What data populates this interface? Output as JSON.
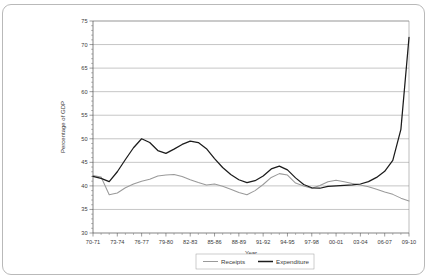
{
  "figure": {
    "border_color": "#b9b9b9",
    "background": "#ffffff"
  },
  "chart_data": {
    "type": "line",
    "title": "",
    "subtitle": "",
    "xlabel": "Year",
    "ylabel": "Percentage of GDP",
    "ylim": [
      30,
      75
    ],
    "ytick_step": 5,
    "yticks": [
      30,
      35,
      40,
      45,
      50,
      55,
      60,
      65,
      70,
      75
    ],
    "ytick_labels": [
      "30",
      "35",
      "40",
      "45",
      "50",
      "55",
      "60",
      "65",
      "70",
      "75"
    ],
    "grid": true,
    "grid_axis": "y",
    "legend_position": "bottom-center",
    "x": [
      "70-71",
      "71-72",
      "72-73",
      "73-74",
      "74-75",
      "75-76",
      "76-77",
      "77-78",
      "78-79",
      "79-80",
      "80-81",
      "81-82",
      "82-83",
      "83-84",
      "84-85",
      "85-86",
      "86-87",
      "87-88",
      "88-89",
      "89-90",
      "90-91",
      "91-92",
      "92-93",
      "93-94",
      "94-95",
      "95-96",
      "96-97",
      "97-98",
      "98-99",
      "99-00",
      "00-01",
      "01-02",
      "02-03",
      "03-04",
      "04-05",
      "05-06",
      "06-07",
      "07-08",
      "08-09",
      "09-10"
    ],
    "xtick_labels": [
      "70-71",
      "73-74",
      "76-77",
      "79-80",
      "82-83",
      "85-86",
      "88-89",
      "91-92",
      "94-95",
      "97-98",
      "00-01",
      "03-04",
      "06-07",
      "09-10"
    ],
    "xtick_every": 3,
    "series": [
      {
        "name": "Receipts",
        "color": "#9a9a9a",
        "values": [
          42.2,
          41.9,
          38.1,
          38.5,
          39.6,
          40.4,
          41.0,
          41.4,
          42.1,
          42.3,
          42.4,
          42.0,
          41.3,
          40.7,
          40.2,
          40.4,
          39.9,
          39.3,
          38.6,
          38.1,
          39.0,
          40.3,
          41.8,
          42.6,
          42.3,
          40.6,
          40.0,
          39.5,
          40.1,
          40.9,
          41.2,
          40.9,
          40.5,
          40.2,
          39.8,
          39.3,
          38.7,
          38.2,
          37.4,
          36.8
        ]
      },
      {
        "name": "Expenditure",
        "color": "#1c1c1c",
        "values": [
          42.0,
          41.6,
          40.9,
          43.0,
          45.6,
          48.1,
          50.0,
          49.2,
          47.5,
          46.9,
          47.8,
          48.8,
          49.5,
          49.2,
          47.9,
          45.8,
          43.9,
          42.4,
          41.3,
          40.7,
          41.1,
          42.1,
          43.6,
          44.2,
          43.4,
          41.7,
          40.3,
          39.6,
          39.5,
          39.9,
          40.0,
          40.1,
          40.2,
          40.4,
          40.9,
          41.8,
          43.1,
          45.4,
          52.0,
          71.5
        ]
      }
    ],
    "legend_entries": [
      "Receipts",
      "Expenditure"
    ]
  },
  "legend": {
    "receipts_label": "Receipts",
    "expenditure_label": "Expenditure"
  },
  "axis": {
    "x_title": "Year",
    "y_title": "Percentage of GDP"
  }
}
